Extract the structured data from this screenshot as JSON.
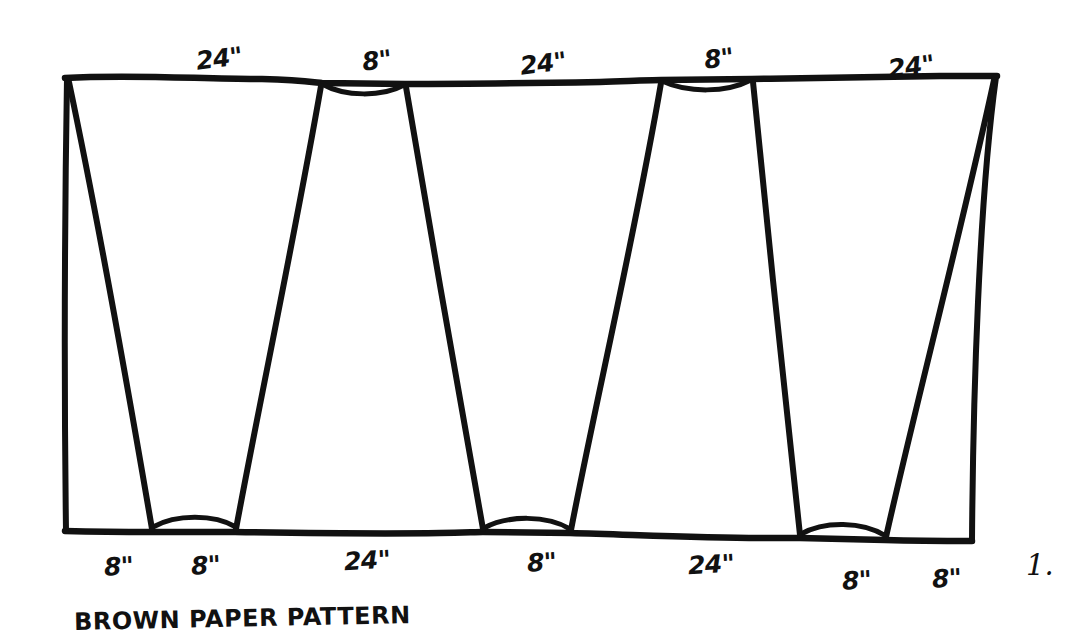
{
  "diagram": {
    "caption": "BROWN PAPER PATTERN",
    "figure_number": "1.",
    "ink_color": "#111111",
    "paper_color": "#ffffff",
    "unit": "inches",
    "top_edge_labels": [
      {
        "text": "24\"",
        "x": 196,
        "y": 44
      },
      {
        "text": "8\"",
        "x": 362,
        "y": 46
      },
      {
        "text": "24\"",
        "x": 520,
        "y": 49
      },
      {
        "text": "8\"",
        "x": 704,
        "y": 44
      },
      {
        "text": "24\"",
        "x": 888,
        "y": 52
      }
    ],
    "bottom_edge_labels": [
      {
        "text": "8\"",
        "x": 104,
        "y": 552
      },
      {
        "text": "8\"",
        "x": 191,
        "y": 551
      },
      {
        "text": "24\"",
        "x": 344,
        "y": 546
      },
      {
        "text": "8\"",
        "x": 527,
        "y": 548
      },
      {
        "text": "24\"",
        "x": 688,
        "y": 550
      },
      {
        "text": "8\"",
        "x": 842,
        "y": 566
      },
      {
        "text": "8\"",
        "x": 932,
        "y": 564
      }
    ],
    "outline": {
      "top_left": {
        "x": 65,
        "y": 77
      },
      "top_right": {
        "x": 997,
        "y": 76
      },
      "bottom_left": {
        "x": 65,
        "y": 532
      },
      "bottom_right": {
        "x": 972,
        "y": 541
      }
    },
    "top_notches": [
      {
        "label": "8\"",
        "from_x": 320,
        "to_x": 405
      },
      {
        "label": "8\"",
        "from_x": 660,
        "to_x": 752
      }
    ],
    "bottom_notches": [
      {
        "label": "8\"",
        "from_x": 152,
        "to_x": 235
      },
      {
        "label": "8\"",
        "from_x": 483,
        "to_x": 570
      },
      {
        "label": "8\"",
        "from_x": 800,
        "to_x": 885
      }
    ],
    "panels": [
      {
        "name": "panel-1",
        "top_from_x": 65,
        "top_to_x": 320,
        "bottom_from_x": 65,
        "bottom_to_x": 152,
        "top_span": "24\"",
        "bottom_span": "8\""
      },
      {
        "name": "panel-2",
        "top_from_x": 320,
        "top_to_x": 405,
        "bottom_from_x": 152,
        "bottom_to_x": 483,
        "top_span": "8\"",
        "bottom_span": "24\""
      },
      {
        "name": "panel-3",
        "top_from_x": 405,
        "top_to_x": 660,
        "bottom_from_x": 483,
        "bottom_to_x": 570,
        "top_span": "24\"",
        "bottom_span": "8\""
      },
      {
        "name": "panel-4",
        "top_from_x": 660,
        "top_to_x": 752,
        "bottom_from_x": 570,
        "bottom_to_x": 800,
        "top_span": "8\"",
        "bottom_span": "24\""
      },
      {
        "name": "panel-5",
        "top_from_x": 752,
        "top_to_x": 997,
        "bottom_from_x": 800,
        "bottom_to_x": 885,
        "top_span": "24\"",
        "bottom_span": "8\""
      }
    ]
  }
}
